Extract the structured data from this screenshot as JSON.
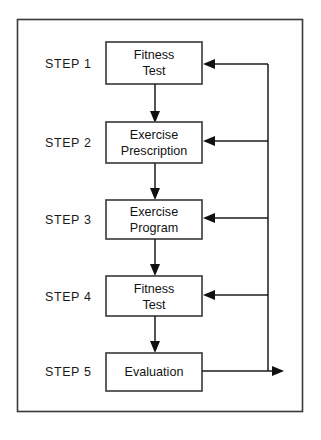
{
  "diagram": {
    "type": "flowchart",
    "orientation": "vertical-with-feedback-loop",
    "colors": {
      "background": "#fefefe",
      "frame_border": "#3a3a3a",
      "box_border": "#434343",
      "box_fill": "#ffffff",
      "line": "#1b1b1b",
      "text": "#131313"
    },
    "steps": [
      {
        "step_label": "STEP 1",
        "node_lines": [
          "Fitness",
          "Test"
        ],
        "node_text": "Fitness Test",
        "receives_feedback": true
      },
      {
        "step_label": "STEP 2",
        "node_lines": [
          "Exercise",
          "Prescription"
        ],
        "node_text": "Exercise Prescription",
        "receives_feedback": true
      },
      {
        "step_label": "STEP 3",
        "node_lines": [
          "Exercise",
          "Program"
        ],
        "node_text": "Exercise Program",
        "receives_feedback": true
      },
      {
        "step_label": "STEP 4",
        "node_lines": [
          "Fitness",
          "Test"
        ],
        "node_text": "Fitness Test",
        "receives_feedback": true
      },
      {
        "step_label": "STEP 5",
        "node_lines": [
          "Evaluation"
        ],
        "node_text": "Evaluation",
        "receives_feedback": false
      }
    ],
    "connectors": {
      "downward_count": 4,
      "feedback_branch_count": 4,
      "feedback_source": "Evaluation",
      "feedback_targets": [
        "Fitness Test",
        "Exercise Prescription",
        "Exercise Program",
        "Fitness Test"
      ]
    }
  }
}
